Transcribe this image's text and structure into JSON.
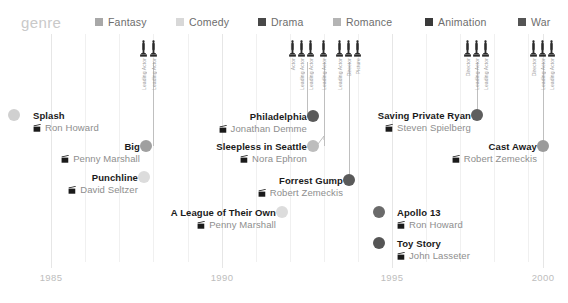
{
  "legend": {
    "title": "genre",
    "items": [
      {
        "label": "Fantasy",
        "color": "#a8a8a8",
        "x": 95
      },
      {
        "label": "Comedy",
        "color": "#d8d8d8",
        "x": 176
      },
      {
        "label": "Drama",
        "color": "#484848",
        "x": 258
      },
      {
        "label": "Romance",
        "color": "#b4b4b4",
        "x": 333
      },
      {
        "label": "Animation",
        "color": "#3a3a3a",
        "x": 425
      },
      {
        "label": "War",
        "color": "#545454",
        "x": 518
      }
    ]
  },
  "axis": {
    "ticks": [
      {
        "label": "1985",
        "x": 51
      },
      {
        "label": "1990",
        "x": 222
      },
      {
        "label": "1995",
        "x": 392
      },
      {
        "label": "2000",
        "x": 543
      }
    ],
    "gridlines_x": [
      51,
      85,
      119,
      153,
      188,
      222,
      256,
      290,
      324,
      358,
      392,
      426,
      460,
      494,
      528,
      543
    ]
  },
  "chart_data": {
    "type": "scatter",
    "title": "genre",
    "xlabel": "",
    "ylabel": "",
    "xlim": [
      1984,
      2000
    ],
    "grid": true,
    "legend_position": "top",
    "categories": [
      "Fantasy",
      "Comedy",
      "Drama",
      "Romance",
      "Animation",
      "War"
    ],
    "points": [
      {
        "title": "Splash",
        "director": "Ron Howard",
        "year": 1984,
        "genre": "Comedy",
        "color": "#d0d0d0"
      },
      {
        "title": "Big",
        "director": "Penny Marshall",
        "year": 1988,
        "genre": "Fantasy",
        "color": "#a0a0a0"
      },
      {
        "title": "Punchline",
        "director": "David Seltzer",
        "year": 1988,
        "genre": "Comedy",
        "color": "#dcdcdc"
      },
      {
        "title": "A League of Their Own",
        "director": "Penny Marshall",
        "year": 1992,
        "genre": "Comedy",
        "color": "#dcdcdc"
      },
      {
        "title": "Sleepless in Seattle",
        "director": "Nora Ephron",
        "year": 1993,
        "genre": "Romance",
        "color": "#bdbdbd"
      },
      {
        "title": "Philadelphia",
        "director": "Jonathan Demme",
        "year": 1993,
        "genre": "Drama",
        "color": "#5a5a5a"
      },
      {
        "title": "Forrest Gump",
        "director": "Robert Zemeckis",
        "year": 1994,
        "genre": "Drama",
        "color": "#5a5a5a"
      },
      {
        "title": "Apollo 13",
        "director": "Ron Howard",
        "year": 1995,
        "genre": "Drama",
        "color": "#6a6a6a"
      },
      {
        "title": "Toy Story",
        "director": "John Lasseter",
        "year": 1995,
        "genre": "Animation",
        "color": "#555555"
      },
      {
        "title": "Saving Private Ryan",
        "director": "Steven Spielberg",
        "year": 1998,
        "genre": "War",
        "color": "#5e5e5e"
      },
      {
        "title": "Cast Away",
        "director": "Robert Zemeckis",
        "year": 2000,
        "genre": "Drama",
        "color": "#9b9b9b"
      }
    ],
    "awards": [
      {
        "year": 1988,
        "labels": [
          "Leading Actor",
          "Leading Actor"
        ]
      },
      {
        "year": 1993,
        "labels": [
          "Actor",
          "Leading Actor",
          "Leading Actor",
          "Leading Actor"
        ]
      },
      {
        "year": 1994,
        "labels": [
          "Leading Actor",
          "Director",
          "Picture"
        ]
      },
      {
        "year": 1998,
        "labels": [
          "Director",
          "Leading Actor",
          "Leading Actor"
        ]
      },
      {
        "year": 2000,
        "labels": [
          "Director",
          "Leading Actor",
          "Leading Actor"
        ]
      }
    ]
  },
  "films": [
    {
      "title": "Splash",
      "director": "Ron Howard",
      "color": "#d0d0d0",
      "dot_x": 14,
      "dot_y": 115,
      "text_x": 33,
      "text_y": 110,
      "align": "left",
      "size": "sm"
    },
    {
      "title": "Big",
      "director": "Penny Marshall",
      "color": "#a0a0a0",
      "dot_x": 146,
      "dot_y": 146,
      "text_x": 140,
      "text_y": 141,
      "align": "right",
      "size": "sm"
    },
    {
      "title": "Punchline",
      "director": "David Seltzer",
      "color": "#dcdcdc",
      "dot_x": 144,
      "dot_y": 177,
      "text_x": 138,
      "text_y": 172,
      "align": "right",
      "size": "sm"
    },
    {
      "title": "A League of Their Own",
      "director": "Penny Marshall",
      "color": "#dcdcdc",
      "dot_x": 282,
      "dot_y": 212,
      "text_x": 276,
      "text_y": 207,
      "align": "right",
      "size": "sm"
    },
    {
      "title": "Sleepless in Seattle",
      "director": "Nora Ephron",
      "color": "#bdbdbd",
      "dot_x": 313,
      "dot_y": 146,
      "text_x": 307,
      "text_y": 141,
      "align": "right",
      "size": "sm"
    },
    {
      "title": "Philadelphia",
      "director": "Jonathan Demme",
      "color": "#5a5a5a",
      "dot_x": 313,
      "dot_y": 116,
      "text_x": 307,
      "text_y": 111,
      "align": "right",
      "size": "sm"
    },
    {
      "title": "Forrest Gump",
      "director": "Robert Zemeckis",
      "color": "#5a5a5a",
      "dot_x": 349,
      "dot_y": 180,
      "text_x": 343,
      "text_y": 175,
      "align": "right",
      "size": "sm"
    },
    {
      "title": "Apollo 13",
      "director": "Ron Howard",
      "color": "#6a6a6a",
      "dot_x": 379,
      "dot_y": 212,
      "text_x": 397,
      "text_y": 207,
      "align": "left",
      "size": "sm"
    },
    {
      "title": "Toy Story",
      "director": "John Lasseter",
      "color": "#555555",
      "dot_x": 379,
      "dot_y": 243,
      "text_x": 397,
      "text_y": 238,
      "align": "left",
      "size": "sm"
    },
    {
      "title": "Saving Private Ryan",
      "director": "Steven Spielberg",
      "color": "#5e5e5e",
      "dot_x": 477,
      "dot_y": 115,
      "text_x": 471,
      "text_y": 110,
      "align": "right",
      "size": "sm"
    },
    {
      "title": "Cast Away",
      "director": "Robert Zemeckis",
      "color": "#9b9b9b",
      "dot_x": 543,
      "dot_y": 146,
      "text_x": 537,
      "text_y": 141,
      "align": "right",
      "size": "sm"
    }
  ],
  "award_groups": [
    {
      "x": 153,
      "stem_top": 62,
      "stem_h": 84,
      "cols": [
        {
          "dx": -9,
          "label": "Leading Actor"
        },
        {
          "dx": 1,
          "label": "Leading Actor"
        }
      ]
    },
    {
      "x": 307,
      "stem_top": 62,
      "stem_h": 54,
      "cols": [
        {
          "dx": -14,
          "label": "Actor"
        },
        {
          "dx": -5,
          "label": "Leading Actor"
        },
        {
          "dx": 4,
          "label": "Leading Actor"
        }
      ]
    },
    {
      "x": 324,
      "stem_top": 62,
      "stem_h": 84,
      "cols": [
        {
          "dx": 0,
          "label": "Leading Actor"
        }
      ]
    },
    {
      "x": 349,
      "stem_top": 62,
      "stem_h": 118,
      "cols": [
        {
          "dx": -9,
          "label": "Leading Actor"
        },
        {
          "dx": 0,
          "label": "Director"
        },
        {
          "dx": 9,
          "label": "Picture"
        }
      ]
    },
    {
      "x": 477,
      "stem_top": 62,
      "stem_h": 53,
      "cols": [
        {
          "dx": -9,
          "label": "Director"
        },
        {
          "dx": 0,
          "label": "Leading Actor"
        },
        {
          "dx": 9,
          "label": "Leading Actor"
        }
      ]
    },
    {
      "x": 543,
      "stem_top": 62,
      "stem_h": 84,
      "cols": [
        {
          "dx": -9,
          "label": "Director"
        },
        {
          "dx": 0,
          "label": "Leading Actor"
        },
        {
          "dx": 9,
          "label": "Leading Actor"
        }
      ]
    }
  ]
}
